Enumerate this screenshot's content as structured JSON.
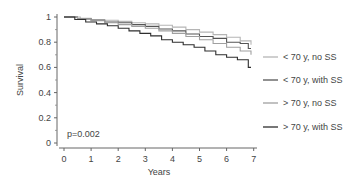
{
  "chart_data": {
    "type": "line",
    "subtype": "kaplan-meier step",
    "title": "",
    "xlabel": "Years",
    "ylabel": "Survival",
    "xlim": [
      0,
      7
    ],
    "ylim": [
      0,
      1
    ],
    "xticks": [
      "0",
      "1",
      "2",
      "3",
      "4",
      "5",
      "6",
      "7"
    ],
    "yticks": [
      "0",
      "0.2",
      "0.4",
      "0.6",
      "0.8",
      "1"
    ],
    "grid": false,
    "legend_position": "right",
    "annotation": "p=0.002",
    "series": [
      {
        "name": "< 70 y, no SS",
        "color": "#b5b5b5",
        "x": [
          0,
          0.6,
          1.0,
          1.5,
          2.0,
          2.5,
          3.0,
          3.5,
          4.0,
          4.5,
          5.0,
          5.5,
          6.0,
          6.5,
          6.9
        ],
        "y": [
          1.0,
          0.99,
          0.98,
          0.975,
          0.965,
          0.955,
          0.945,
          0.935,
          0.92,
          0.9,
          0.88,
          0.86,
          0.84,
          0.81,
          0.78
        ]
      },
      {
        "name": "< 70 y, with SS",
        "color": "#555555",
        "x": [
          0,
          0.5,
          1.0,
          1.5,
          2.0,
          2.5,
          3.0,
          3.5,
          4.0,
          4.5,
          5.0,
          5.5,
          6.0,
          6.5,
          6.8,
          6.9
        ],
        "y": [
          1.0,
          0.985,
          0.975,
          0.96,
          0.955,
          0.94,
          0.925,
          0.905,
          0.89,
          0.865,
          0.845,
          0.83,
          0.8,
          0.79,
          0.75,
          0.75
        ]
      },
      {
        "name": "> 70 y, no SS",
        "color": "#a0a0a0",
        "x": [
          0,
          0.5,
          1.0,
          1.5,
          2.0,
          2.5,
          3.0,
          3.5,
          4.0,
          4.5,
          5.0,
          5.5,
          6.0,
          6.5,
          6.9
        ],
        "y": [
          1.0,
          0.985,
          0.97,
          0.955,
          0.94,
          0.925,
          0.91,
          0.89,
          0.87,
          0.845,
          0.82,
          0.79,
          0.76,
          0.73,
          0.7
        ]
      },
      {
        "name": "> 70 y, with SS",
        "color": "#2e2e2e",
        "x": [
          0,
          0.4,
          0.8,
          1.2,
          1.6,
          2.0,
          2.4,
          2.8,
          3.2,
          3.6,
          4.0,
          4.4,
          4.8,
          5.2,
          5.6,
          6.0,
          6.4,
          6.8,
          6.9
        ],
        "y": [
          1.0,
          0.98,
          0.96,
          0.945,
          0.93,
          0.91,
          0.89,
          0.87,
          0.85,
          0.82,
          0.8,
          0.78,
          0.76,
          0.73,
          0.7,
          0.68,
          0.66,
          0.6,
          0.6
        ]
      }
    ]
  }
}
